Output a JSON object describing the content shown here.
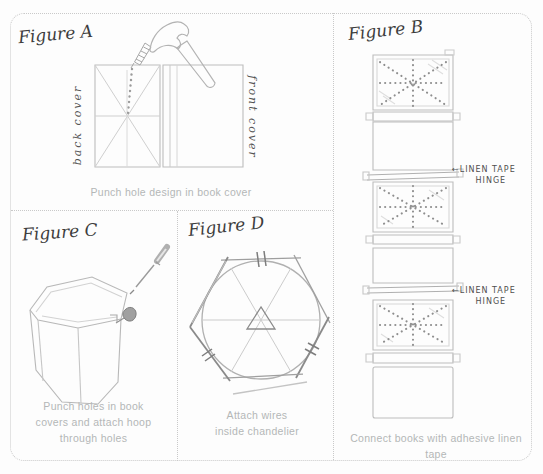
{
  "figure_a": {
    "label": "Figure A",
    "caption": "Punch hole design in book cover",
    "back_cover_label": "back cover",
    "front_cover_label": "front cover"
  },
  "figure_b": {
    "label": "Figure B",
    "caption": "Connect books with adhesive linen tape",
    "hinge_labels": [
      {
        "arrow": "←",
        "line1": "LINEN TAPE",
        "line2": "HINGE"
      },
      {
        "arrow": "←",
        "line1": "LINEN TAPE",
        "line2": "HINGE"
      }
    ]
  },
  "figure_c": {
    "label": "Figure C",
    "caption_lines": [
      "Punch holes in book",
      "covers and attach hoop",
      "through holes"
    ]
  },
  "figure_d": {
    "label": "Figure D",
    "caption_lines": [
      "Attach wires",
      "inside chandelier"
    ]
  }
}
